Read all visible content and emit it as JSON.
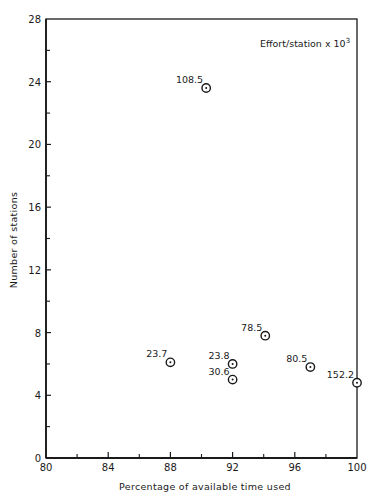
{
  "chart_data": {
    "type": "scatter",
    "title": "",
    "annotation": "Effort/station x 10",
    "annotation_superscript": "3",
    "xlabel": "Percentage of available time used",
    "ylabel": "Number of stations",
    "xlim": [
      80,
      100
    ],
    "ylim": [
      0,
      28
    ],
    "x_major_ticks": [
      80,
      84,
      88,
      92,
      96,
      100
    ],
    "x_minor_ticks": [
      82,
      86,
      90,
      94,
      98
    ],
    "y_major_ticks": [
      0,
      4,
      8,
      12,
      16,
      20,
      24,
      28
    ],
    "y_minor_ticks": [
      2,
      6,
      10,
      14,
      18,
      22,
      26
    ],
    "grid": false,
    "marker": "circled-dot",
    "points": [
      {
        "x": 90.3,
        "y": 23.6,
        "label": "108.5"
      },
      {
        "x": 88.0,
        "y": 6.1,
        "label": "23.7"
      },
      {
        "x": 92.0,
        "y": 6.0,
        "label": "23.8"
      },
      {
        "x": 92.0,
        "y": 5.0,
        "label": "30.6"
      },
      {
        "x": 94.1,
        "y": 7.8,
        "label": "78.5"
      },
      {
        "x": 97.0,
        "y": 5.8,
        "label": "80.5"
      },
      {
        "x": 100.0,
        "y": 4.8,
        "label": "152.2"
      }
    ]
  },
  "colors": {
    "ink": "#1a1a1a",
    "background": "#ffffff"
  }
}
